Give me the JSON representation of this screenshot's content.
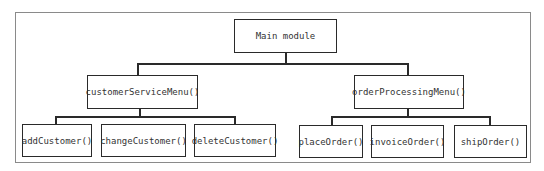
{
  "diagram": {
    "type": "hierarchy-chart",
    "root": {
      "label": "Main module"
    },
    "level1": [
      {
        "label": "customerServiceMenu()"
      },
      {
        "label": "orderProcessingMenu()"
      }
    ],
    "level2": {
      "customerServiceMenu": [
        {
          "label": "addCustomer()"
        },
        {
          "label": "changeCustomer()"
        },
        {
          "label": "deleteCustomer()"
        }
      ],
      "orderProcessingMenu": [
        {
          "label": "placeOrder()"
        },
        {
          "label": "invoiceOrder()"
        },
        {
          "label": "shipOrder()"
        }
      ]
    },
    "colors": {
      "line": "#2a2a2a",
      "frame": "#8a8a8a",
      "text": "#333333"
    }
  }
}
